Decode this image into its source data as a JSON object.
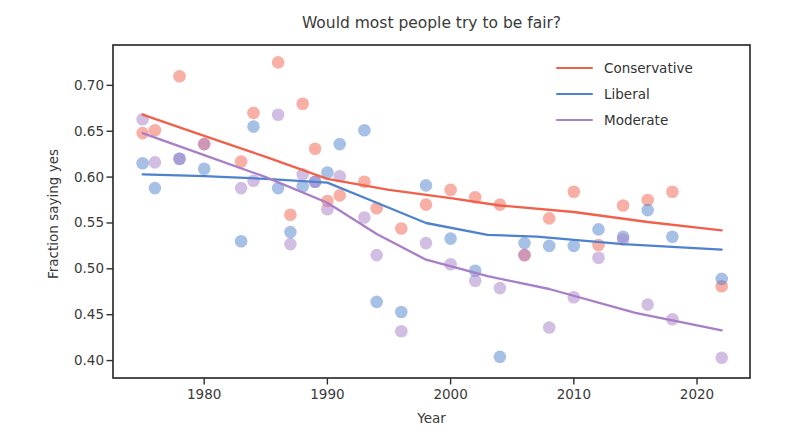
{
  "figure": {
    "background": "#ffffff"
  },
  "chart_data": {
    "type": "scatter",
    "title": "Would most people try to be fair?",
    "xlabel": "Year",
    "ylabel": "Fraction saying yes",
    "x_ticks": [
      1980,
      1990,
      2000,
      2010,
      2020
    ],
    "y_ticks": [
      0.4,
      0.45,
      0.5,
      0.55,
      0.6,
      0.65,
      0.7
    ],
    "xlim": [
      1972.6,
      2024.3
    ],
    "ylim": [
      0.381,
      0.744
    ],
    "grid": false,
    "legend_position": "upper right",
    "years": [
      1975,
      1976,
      1978,
      1980,
      1983,
      1984,
      1986,
      1987,
      1988,
      1989,
      1990,
      1991,
      1993,
      1994,
      1996,
      1998,
      2000,
      2002,
      2004,
      2006,
      2008,
      2010,
      2012,
      2014,
      2016,
      2018,
      2022
    ],
    "series": [
      {
        "name": "Conservative",
        "color": "#f1604b",
        "values": [
          0.648,
          0.651,
          0.71,
          0.636,
          0.617,
          0.67,
          0.725,
          0.559,
          0.68,
          0.631,
          0.574,
          0.58,
          0.595,
          0.566,
          0.544,
          0.57,
          0.586,
          0.578,
          0.57,
          0.515,
          0.555,
          0.584,
          0.526,
          0.569,
          0.575,
          0.584,
          0.481
        ],
        "trend": {
          "x": [
            1975,
            1980,
            1985,
            1990,
            1995,
            2000,
            2004,
            2010,
            2016,
            2022
          ],
          "y": [
            0.668,
            0.645,
            0.622,
            0.598,
            0.586,
            0.577,
            0.569,
            0.562,
            0.551,
            0.542
          ]
        }
      },
      {
        "name": "Liberal",
        "color": "#4f82cd",
        "values": [
          0.615,
          0.588,
          0.62,
          0.609,
          0.53,
          0.655,
          0.588,
          0.54,
          0.59,
          0.595,
          0.605,
          0.636,
          0.651,
          0.464,
          0.453,
          0.591,
          0.533,
          0.498,
          0.404,
          0.528,
          0.525,
          0.525,
          0.543,
          0.535,
          0.564,
          0.535,
          0.489
        ],
        "trend": {
          "x": [
            1975,
            1980,
            1985,
            1990,
            1994,
            1998,
            2003,
            2007,
            2014,
            2022
          ],
          "y": [
            0.603,
            0.601,
            0.598,
            0.594,
            0.572,
            0.55,
            0.537,
            0.535,
            0.527,
            0.521
          ]
        }
      },
      {
        "name": "Moderate",
        "color": "#a87ec7",
        "values": [
          0.663,
          0.616,
          0.62,
          0.636,
          0.588,
          0.596,
          0.668,
          0.527,
          0.603,
          0.595,
          0.565,
          0.601,
          0.556,
          0.515,
          0.432,
          0.528,
          0.505,
          0.487,
          0.479,
          0.515,
          0.436,
          0.469,
          0.512,
          0.532,
          0.461,
          0.445,
          0.403
        ],
        "trend": {
          "x": [
            1975,
            1980,
            1985,
            1990,
            1994,
            1998,
            2003,
            2008,
            2015,
            2022
          ],
          "y": [
            0.648,
            0.624,
            0.6,
            0.572,
            0.538,
            0.51,
            0.492,
            0.478,
            0.452,
            0.433
          ]
        }
      }
    ],
    "style": {
      "marker_opacity": 0.5,
      "marker_radius": 6.3,
      "line_width": 2.3,
      "axis_color": "#2f2f2f",
      "text_color": "#3a3a3a",
      "tick_font_size": 13.5
    }
  }
}
